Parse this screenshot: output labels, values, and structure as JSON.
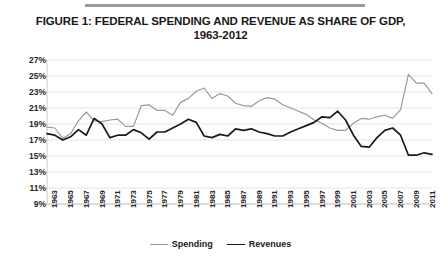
{
  "figure": {
    "title_line1": "FIGURE 1: FEDERAL SPENDING AND REVENUE AS SHARE OF GDP,",
    "title_line2": "1963-2012"
  },
  "legend": {
    "position": "bottom-center",
    "entries": [
      {
        "label": "Spending",
        "color": "#9a9a9a"
      },
      {
        "label": "Revenues",
        "color": "#1a1a1a"
      }
    ]
  },
  "axes": {
    "y_ticks": [
      "9%",
      "11%",
      "13%",
      "15%",
      "17%",
      "19%",
      "21%",
      "23%",
      "25%",
      "27%"
    ],
    "x_ticks": [
      "1963",
      "1965",
      "1967",
      "1969",
      "1971",
      "1973",
      "1975",
      "1977",
      "1979",
      "1981",
      "1983",
      "1985",
      "1987",
      "1989",
      "1991",
      "1993",
      "1995",
      "1997",
      "1999",
      "2001",
      "2003",
      "2005",
      "2007",
      "2009",
      "2011"
    ]
  },
  "colors": {
    "spending": "#9a9a9a",
    "revenues": "#1a1a1a",
    "gridline": "#e3e3e3",
    "axis_text": "#262626",
    "rule": "#9a9a9a"
  },
  "chart_data": {
    "type": "line",
    "title": "FIGURE 1: FEDERAL SPENDING AND REVENUE AS SHARE OF GDP, 1963-2012",
    "xlabel": "",
    "ylabel": "",
    "ylim": [
      9,
      27
    ],
    "ytick_step": 2,
    "grid": true,
    "legend_position": "bottom-center",
    "x": [
      1963,
      1964,
      1965,
      1966,
      1967,
      1968,
      1969,
      1970,
      1971,
      1972,
      1973,
      1974,
      1975,
      1976,
      1977,
      1978,
      1979,
      1980,
      1981,
      1982,
      1983,
      1984,
      1985,
      1986,
      1987,
      1988,
      1989,
      1990,
      1991,
      1992,
      1993,
      1994,
      1995,
      1996,
      1997,
      1998,
      1999,
      2000,
      2001,
      2002,
      2003,
      2004,
      2005,
      2006,
      2007,
      2008,
      2009,
      2010,
      2011,
      2012
    ],
    "series": [
      {
        "name": "Spending",
        "color": "#9a9a9a",
        "values": [
          18.6,
          18.5,
          17.2,
          17.8,
          19.4,
          20.5,
          19.4,
          19.3,
          19.5,
          19.6,
          18.7,
          18.7,
          21.3,
          21.4,
          20.7,
          20.7,
          20.1,
          21.7,
          22.2,
          23.1,
          23.5,
          22.2,
          22.8,
          22.5,
          21.6,
          21.3,
          21.2,
          21.9,
          22.3,
          22.1,
          21.4,
          21.0,
          20.6,
          20.2,
          19.5,
          19.1,
          18.5,
          18.2,
          18.2,
          19.1,
          19.7,
          19.6,
          19.9,
          20.1,
          19.7,
          20.8,
          25.2,
          24.1,
          24.1,
          22.8
        ]
      },
      {
        "name": "Revenues",
        "color": "#1a1a1a",
        "values": [
          17.8,
          17.6,
          17.0,
          17.4,
          18.3,
          17.6,
          19.7,
          19.0,
          17.3,
          17.6,
          17.6,
          18.3,
          17.9,
          17.1,
          18.0,
          18.0,
          18.5,
          19.0,
          19.6,
          19.2,
          17.5,
          17.3,
          17.7,
          17.5,
          18.4,
          18.2,
          18.4,
          18.0,
          17.8,
          17.5,
          17.5,
          18.0,
          18.4,
          18.8,
          19.2,
          19.9,
          19.8,
          20.6,
          19.5,
          17.6,
          16.2,
          16.1,
          17.3,
          18.2,
          18.5,
          17.6,
          15.1,
          15.1,
          15.4,
          15.2
        ]
      }
    ]
  }
}
